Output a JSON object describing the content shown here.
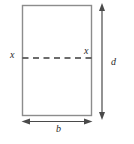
{
  "figure": {
    "labels": {
      "axis_left": "x",
      "axis_right": "x",
      "depth": "d",
      "breadth": "b"
    },
    "colors": {
      "background": "#ffffff",
      "rect_border": "#8c8c8c",
      "axis_line": "#3d3d3d",
      "dimension_line": "#4a4a4a",
      "label_text": "#2b2b2b"
    }
  }
}
